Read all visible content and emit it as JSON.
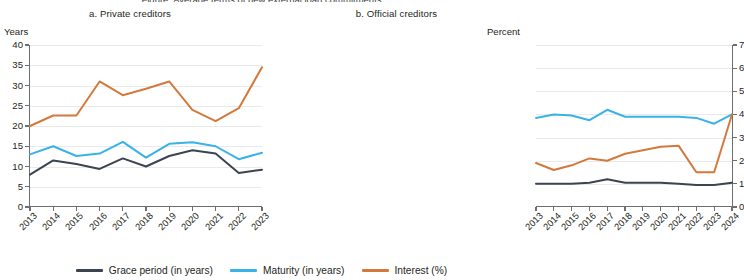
{
  "cut_title": "Figure: Average terms of new external loan commitments",
  "panels": [
    {
      "key": "private",
      "title": "a. Private creditors",
      "unit": "Years"
    },
    {
      "key": "official",
      "title": "b. Official creditors",
      "unit": "Percent"
    }
  ],
  "legend": [
    {
      "label": "Grace period (in years)",
      "color": "#3b4451"
    },
    {
      "label": "Maturity (in years)",
      "color": "#39b2e8"
    },
    {
      "label": "Interest (%)",
      "color": "#d4793c"
    }
  ],
  "chart_data": [
    {
      "type": "line",
      "title": "a. Private creditors",
      "xlabel": "",
      "ylabel": "Years",
      "ylim": [
        0,
        40
      ],
      "yticks": [
        0,
        5,
        10,
        15,
        20,
        25,
        30,
        35,
        40
      ],
      "grid": true,
      "legend_position": "bottom-shared",
      "categories": [
        "2013",
        "2014",
        "2015",
        "2016",
        "2017",
        "2018",
        "2019",
        "2020",
        "2021",
        "2022",
        "2023"
      ],
      "series": [
        {
          "name": "Grace period (in years)",
          "color": "#3b4451",
          "values": [
            8.0,
            11.5,
            10.6,
            9.4,
            12.0,
            10.0,
            12.6,
            14.0,
            13.2,
            8.4,
            9.2
          ]
        },
        {
          "name": "Maturity (in years)",
          "color": "#39b2e8",
          "values": [
            13.0,
            15.0,
            12.6,
            13.2,
            16.1,
            12.2,
            15.6,
            16.0,
            15.0,
            11.8,
            13.4
          ]
        },
        {
          "name": "Interest (%)",
          "color": "#d4793c",
          "values": [
            20.0,
            22.6,
            22.6,
            31.0,
            27.6,
            29.2,
            31.0,
            24.0,
            21.2,
            24.4,
            34.5
          ]
        }
      ]
    },
    {
      "type": "line",
      "title": "b. Official creditors",
      "xlabel": "",
      "ylabel": "Percent",
      "ylim": [
        0,
        7
      ],
      "yticks": [
        0,
        1,
        2,
        3,
        4,
        5,
        6,
        7
      ],
      "grid": true,
      "legend_position": "bottom-shared",
      "categories": [
        "2013",
        "2014",
        "2015",
        "2016",
        "2017",
        "2018",
        "2019",
        "2020",
        "2021",
        "2022",
        "2023",
        "2024"
      ],
      "series": [
        {
          "name": "Grace period (in years)",
          "color": "#3b4451",
          "values": [
            1.0,
            1.0,
            1.0,
            1.05,
            1.2,
            1.05,
            1.05,
            1.05,
            1.0,
            0.95,
            0.95,
            1.05
          ]
        },
        {
          "name": "Maturity (in years)",
          "color": "#39b2e8",
          "values": [
            3.85,
            4.0,
            3.95,
            3.75,
            4.2,
            3.9,
            3.9,
            3.9,
            3.9,
            3.85,
            3.6,
            4.0
          ]
        },
        {
          "name": "Interest (%)",
          "color": "#d4793c",
          "values": [
            1.9,
            1.6,
            1.8,
            2.1,
            2.0,
            2.3,
            2.45,
            2.6,
            2.65,
            1.5,
            1.5,
            4.0
          ]
        }
      ]
    }
  ]
}
